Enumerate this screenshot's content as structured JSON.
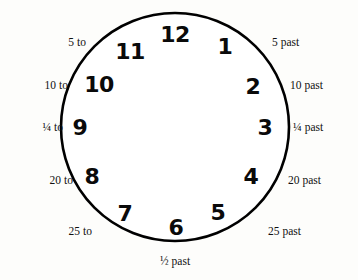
{
  "figure": {
    "name": "clock-face-diagram",
    "stroke_color": "#000000",
    "face_color": "#ffffff",
    "background_color": "#fdfdfb"
  },
  "clock": {
    "hours": [
      {
        "label": "12",
        "x": 175,
        "y": 35
      },
      {
        "label": "1",
        "x": 225,
        "y": 47
      },
      {
        "label": "2",
        "x": 253,
        "y": 87
      },
      {
        "label": "3",
        "x": 265,
        "y": 128
      },
      {
        "label": "4",
        "x": 251,
        "y": 177
      },
      {
        "label": "5",
        "x": 218,
        "y": 213
      },
      {
        "label": "6",
        "x": 176,
        "y": 228
      },
      {
        "label": "7",
        "x": 125,
        "y": 214
      },
      {
        "label": "8",
        "x": 92,
        "y": 177
      },
      {
        "label": "9",
        "x": 80,
        "y": 128
      },
      {
        "label": "10",
        "x": 99,
        "y": 85
      },
      {
        "label": "11",
        "x": 130,
        "y": 52
      }
    ]
  },
  "minute_labels": {
    "past": [
      {
        "num": "5",
        "word": "past",
        "x": 272,
        "y": 43
      },
      {
        "num": "10",
        "word": "past",
        "x": 290,
        "y": 86
      },
      {
        "num": "¼",
        "word": "past",
        "x": 293,
        "y": 128
      },
      {
        "num": "20",
        "word": "past",
        "x": 288,
        "y": 181
      },
      {
        "num": "25",
        "word": "past",
        "x": 268,
        "y": 232
      },
      {
        "num": "½",
        "word": "past",
        "x": 175,
        "y": 262
      }
    ],
    "to": [
      {
        "num": "5",
        "word": "to",
        "x": 86,
        "y": 43
      },
      {
        "num": "10",
        "word": "to",
        "x": 68,
        "y": 86
      },
      {
        "num": "¼",
        "word": "to",
        "x": 63,
        "y": 128
      },
      {
        "num": "20",
        "word": "to",
        "x": 73,
        "y": 181
      },
      {
        "num": "25",
        "word": "to",
        "x": 92,
        "y": 232
      }
    ]
  }
}
